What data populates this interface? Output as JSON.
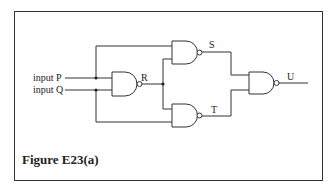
{
  "figure": {
    "caption": "Figure E23(a)",
    "border_color": "#333333",
    "line_color": "#333333"
  },
  "inputs": [
    {
      "label": "input P"
    },
    {
      "label": "input Q"
    }
  ],
  "gates": [
    {
      "type": "NAND",
      "output_label": "R"
    },
    {
      "type": "NAND",
      "output_label": "S"
    },
    {
      "type": "NAND",
      "output_label": "T"
    },
    {
      "type": "NAND",
      "output_label": "U"
    }
  ]
}
